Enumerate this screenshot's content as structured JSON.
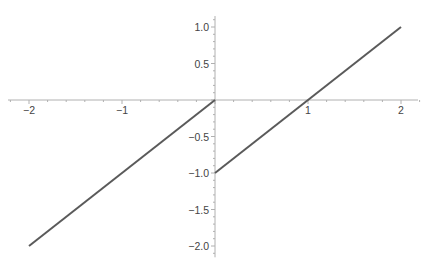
{
  "chart_data": {
    "type": "line",
    "title": "",
    "xlabel": "",
    "ylabel": "",
    "xlim": [
      -2,
      2
    ],
    "ylim": [
      -2.1,
      1.15
    ],
    "grid": false,
    "x_ticks": [
      -2,
      -1,
      1,
      2
    ],
    "x_tick_labels": [
      "−2",
      "−1",
      "1",
      "2"
    ],
    "y_ticks": [
      1.0,
      0.5,
      -0.5,
      -1.0,
      -1.5,
      -2.0
    ],
    "y_tick_labels": [
      "1.0",
      "0.5",
      "−0.5",
      "−1.0",
      "−1.5",
      "−2.0"
    ],
    "series": [
      {
        "name": "piece-left",
        "x": [
          -2,
          0
        ],
        "y": [
          -2,
          0
        ],
        "color": "#5a5a5a"
      },
      {
        "name": "piece-right",
        "x": [
          0,
          2
        ],
        "y": [
          -1,
          1
        ],
        "color": "#5a5a5a"
      }
    ]
  }
}
